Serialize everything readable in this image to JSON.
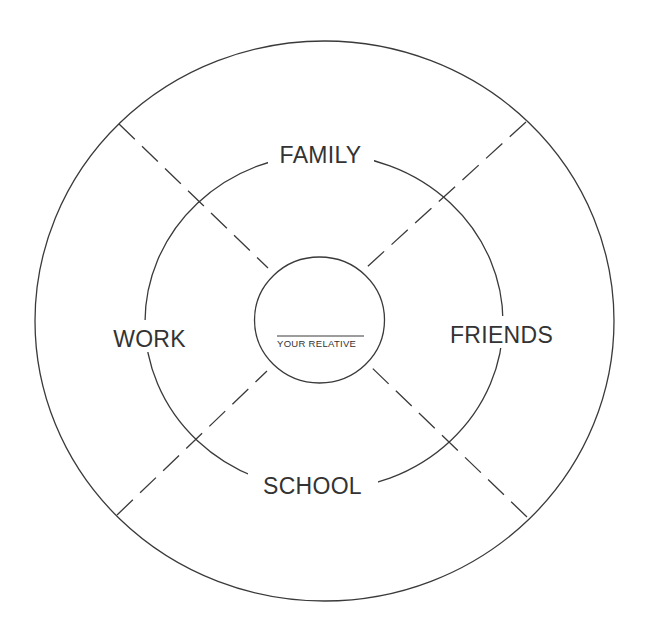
{
  "diagram": {
    "type": "concentric-circle relationship map",
    "center": {
      "label": "YOUR RELATIVE",
      "blank_line": true
    },
    "quadrants": [
      {
        "position": "top",
        "label": "FAMILY"
      },
      {
        "position": "right",
        "label": "FRIENDS"
      },
      {
        "position": "bottom",
        "label": "SCHOOL"
      },
      {
        "position": "left",
        "label": "WORK"
      }
    ],
    "rings": [
      "inner",
      "middle",
      "outer"
    ],
    "dividers": [
      "top-left",
      "top-right",
      "bottom-left",
      "bottom-right"
    ],
    "colors": {
      "stroke": "#3a3a3a",
      "text": "#333333",
      "background": "#ffffff"
    }
  }
}
